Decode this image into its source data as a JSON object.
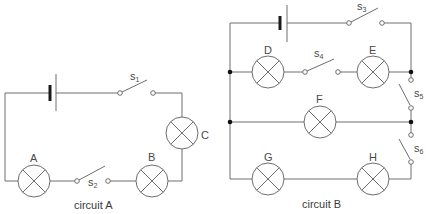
{
  "diagram": {
    "type": "electric-circuits",
    "colors": {
      "wire": "#6e6e6e",
      "battery_plate": "#1a1a1a",
      "junction": "#111111",
      "text": "#4a4a4a"
    },
    "circuit_a": {
      "caption": "circuit A",
      "lamps": [
        {
          "id": "A",
          "label": "A"
        },
        {
          "id": "B",
          "label": "B"
        },
        {
          "id": "C",
          "label": "C"
        }
      ],
      "switches": [
        {
          "id": "s1",
          "letter": "s",
          "sub": "1",
          "state": "open"
        },
        {
          "id": "s2",
          "letter": "s",
          "sub": "2",
          "state": "open"
        }
      ],
      "battery": "cell"
    },
    "circuit_b": {
      "caption": "circuit B",
      "lamps": [
        {
          "id": "D",
          "label": "D"
        },
        {
          "id": "E",
          "label": "E"
        },
        {
          "id": "F",
          "label": "F"
        },
        {
          "id": "G",
          "label": "G"
        },
        {
          "id": "H",
          "label": "H"
        }
      ],
      "switches": [
        {
          "id": "s3",
          "letter": "s",
          "sub": "3",
          "state": "open"
        },
        {
          "id": "s4",
          "letter": "s",
          "sub": "4",
          "state": "open"
        },
        {
          "id": "s5",
          "letter": "s",
          "sub": "5",
          "state": "open"
        },
        {
          "id": "s6",
          "letter": "s",
          "sub": "6",
          "state": "open"
        }
      ],
      "battery": "cell"
    }
  }
}
